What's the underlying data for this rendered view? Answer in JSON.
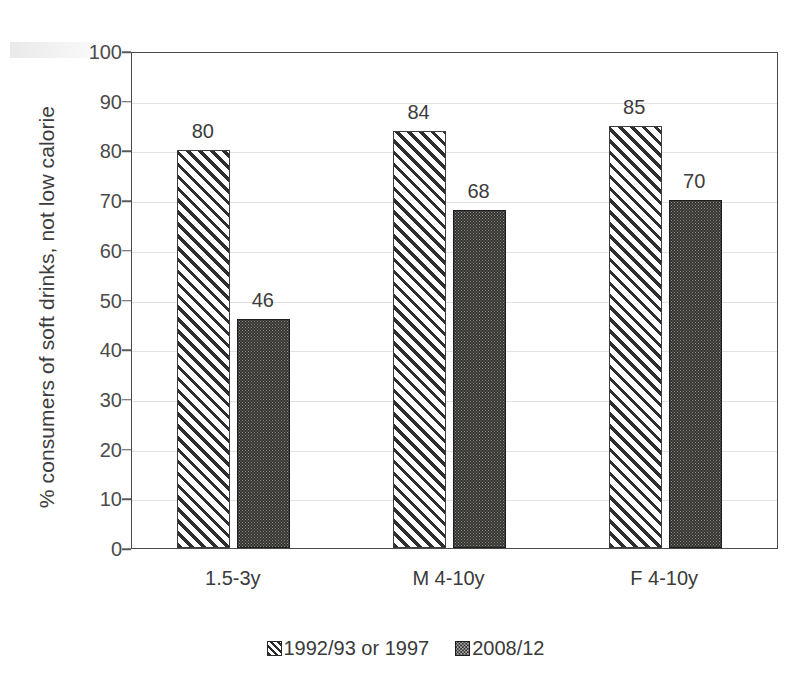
{
  "chart_data": {
    "type": "bar",
    "title": "",
    "xlabel": "",
    "ylabel": "% consumers of  soft drinks, not low calorie",
    "ylim": [
      0,
      100
    ],
    "ytick_step": 10,
    "yticks": [
      100,
      90,
      80,
      70,
      60,
      50,
      40,
      30,
      20,
      10,
      0
    ],
    "categories": [
      "1.5-3y",
      "M 4-10y",
      "F 4-10y"
    ],
    "grid": true,
    "legend_position": "bottom-center",
    "series": [
      {
        "name": "1992/93 or 1997",
        "pattern": "diagonal-hatch",
        "values": [
          80,
          84,
          85
        ],
        "value_labels": [
          "80",
          "84",
          "85"
        ]
      },
      {
        "name": "2008/12",
        "pattern": "dark-dotted",
        "values": [
          46,
          68,
          70
        ],
        "value_labels": [
          "46",
          "68",
          "70"
        ]
      }
    ]
  },
  "legend": {
    "entries": [
      {
        "label": "1992/93 or 1997",
        "swatch": "hatched-square-icon"
      },
      {
        "label": "2008/12",
        "swatch": "dotted-square-icon"
      }
    ]
  },
  "colors": {
    "axis": "#4a4a4a",
    "gridline": "#e2e2e2",
    "text": "#3a3a3a",
    "hatch_line": "#2e2e2e",
    "bar_dark_fill": "#33322f",
    "background": "#ffffff"
  }
}
